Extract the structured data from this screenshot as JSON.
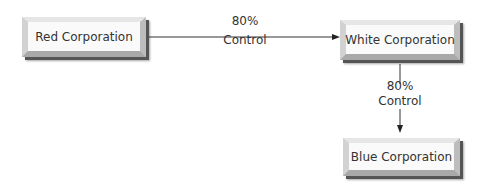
{
  "nodes": [
    {
      "id": "red",
      "label": "Red Corporation"
    },
    {
      "id": "white",
      "label": "White Corporation"
    },
    {
      "id": "blue",
      "label": "Blue Corporation"
    }
  ],
  "edges": [
    {
      "from": "red",
      "to": "white",
      "percent": "80%",
      "label": "Control"
    },
    {
      "from": "white",
      "to": "blue",
      "percent": "80%",
      "label": "Control"
    }
  ]
}
